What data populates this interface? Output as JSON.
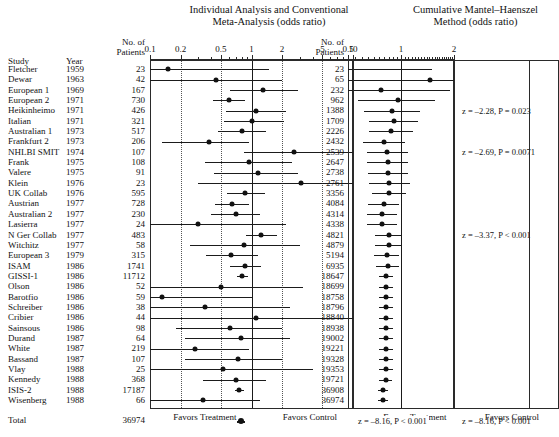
{
  "titles": {
    "left_line1": "Individual Analysis and Conventional",
    "left_line2": "Meta-Analysis (odds ratio)",
    "right_line1": "Cumulative Mantel–Haenszel",
    "right_line2": "Method (odds ratio)"
  },
  "headers": {
    "study": "Study",
    "year": "Year",
    "no_of": "No. of",
    "patients": "Patients",
    "no_of_2": "No. of",
    "patients_2": "Patients"
  },
  "footers": {
    "left_favors_treatment": "Favors Treatment",
    "left_favors_control": "Favors Control",
    "right_favors_treatment": "Favors Treatment",
    "right_favors_control": "Favors Control"
  },
  "annotations": [
    {
      "text": "z = –2.28, P = 0.023",
      "row": 4
    },
    {
      "text": "z = –2.69, P = 0.0071",
      "row": 8
    },
    {
      "text": "z = –3.37, P < 0.001",
      "row": 16
    },
    {
      "text": "z = –8.16, P < 0.001",
      "row": 25
    }
  ],
  "total_stat_left": "z = –8.16, P < 0.001",
  "total_row": {
    "study": "Total",
    "year": "",
    "patients": "36974",
    "cumulative": ""
  },
  "chart_data": {
    "type": "forest",
    "xlabel": "Odds ratio",
    "left_axis": {
      "scale": "log",
      "xlim": [
        0.1,
        10
      ],
      "ticks": [
        0.1,
        0.2,
        0.5,
        1,
        2,
        5,
        10
      ],
      "ticklabels": [
        "0.1",
        "0.2",
        "0.5",
        "1",
        "2",
        "5",
        "10"
      ],
      "reference": 1,
      "dotted_refs": [
        0.2,
        0.5,
        2,
        5
      ]
    },
    "right_axis": {
      "scale": "log",
      "xlim": [
        0.5,
        2
      ],
      "ticks": [
        0.5,
        1,
        2
      ],
      "ticklabels": [
        "0.5",
        "1",
        "2"
      ],
      "reference": 1
    },
    "studies": [
      {
        "study": "Fletcher",
        "year": "1959",
        "patients": "23",
        "or": 0.15,
        "lo": 0.03,
        "hi": 1.5,
        "cum_patients": "23",
        "cum_or": 0.15,
        "cum_lo": 0.03,
        "cum_hi": 1.5
      },
      {
        "study": "Dewar",
        "year": "1963",
        "patients": "42",
        "or": 0.45,
        "lo": 0.09,
        "hi": 2.0,
        "cum_patients": "65",
        "cum_or": 1.47,
        "cum_lo": 0.4,
        "cum_hi": 5.6
      },
      {
        "study": "European 1",
        "year": "1969",
        "patients": "167",
        "or": 1.3,
        "lo": 0.62,
        "hi": 2.9,
        "cum_patients": "232",
        "cum_or": 0.77,
        "cum_lo": 0.38,
        "cum_hi": 1.9
      },
      {
        "study": "European 2",
        "year": "1971",
        "patients": "730",
        "or": 0.6,
        "lo": 0.42,
        "hi": 0.86,
        "cum_patients": "962",
        "cum_or": 0.96,
        "cum_lo": 0.57,
        "cum_hi": 1.55
      },
      {
        "study": "Heikinheimo",
        "year": "1971",
        "patients": "426",
        "or": 1.1,
        "lo": 0.56,
        "hi": 2.2,
        "cum_patients": "1388",
        "cum_or": 0.89,
        "cum_lo": 0.62,
        "cum_hi": 1.28
      },
      {
        "study": "Italian",
        "year": "1971",
        "patients": "321",
        "or": 1.0,
        "lo": 0.53,
        "hi": 2.1,
        "cum_patients": "1709",
        "cum_or": 0.91,
        "cum_lo": 0.66,
        "cum_hi": 1.25
      },
      {
        "study": "Australian 1",
        "year": "1973",
        "patients": "517",
        "or": 0.8,
        "lo": 0.47,
        "hi": 1.4,
        "cum_patients": "2226",
        "cum_or": 0.88,
        "cum_lo": 0.66,
        "cum_hi": 1.17
      },
      {
        "study": "Frankfurt 2",
        "year": "1973",
        "patients": "206",
        "or": 0.38,
        "lo": 0.13,
        "hi": 0.95,
        "cum_patients": "2432",
        "cum_or": 0.8,
        "cum_lo": 0.61,
        "cum_hi": 1.06
      },
      {
        "study": "NHLBI SMIT",
        "year": "1974",
        "patients": "107",
        "or": 2.6,
        "lo": 0.84,
        "hi": 10.0,
        "cum_patients": "2539",
        "cum_or": 0.83,
        "cum_lo": 0.64,
        "cum_hi": 1.09
      },
      {
        "study": "Frank",
        "year": "1975",
        "patients": "108",
        "or": 0.95,
        "lo": 0.35,
        "hi": 2.5,
        "cum_patients": "2647",
        "cum_or": 0.84,
        "cum_lo": 0.64,
        "cum_hi": 1.09
      },
      {
        "study": "Valere",
        "year": "1975",
        "patients": "91",
        "or": 1.15,
        "lo": 0.43,
        "hi": 2.9,
        "cum_patients": "2738",
        "cum_or": 0.84,
        "cum_lo": 0.65,
        "cum_hi": 1.1
      },
      {
        "study": "Klein",
        "year": "1976",
        "patients": "23",
        "or": 3.1,
        "lo": 0.3,
        "hi": 10.0,
        "cum_patients": "2761",
        "cum_or": 0.86,
        "cum_lo": 0.66,
        "cum_hi": 1.12
      },
      {
        "study": "UK Collab",
        "year": "1976",
        "patients": "595",
        "or": 0.87,
        "lo": 0.58,
        "hi": 1.35,
        "cum_patients": "3356",
        "cum_or": 0.85,
        "cum_lo": 0.68,
        "cum_hi": 1.07
      },
      {
        "study": "Austrian",
        "year": "1977",
        "patients": "728",
        "or": 0.64,
        "lo": 0.44,
        "hi": 0.95,
        "cum_patients": "4084",
        "cum_or": 0.8,
        "cum_lo": 0.65,
        "cum_hi": 0.98
      },
      {
        "study": "Australian 2",
        "year": "1977",
        "patients": "230",
        "or": 0.7,
        "lo": 0.4,
        "hi": 1.2,
        "cum_patients": "4314",
        "cum_or": 0.78,
        "cum_lo": 0.64,
        "cum_hi": 0.95
      },
      {
        "study": "Lasierra",
        "year": "1977",
        "patients": "24",
        "or": 0.3,
        "lo": 0.04,
        "hi": 2.2,
        "cum_patients": "4338",
        "cum_or": 0.78,
        "cum_lo": 0.64,
        "cum_hi": 0.95
      },
      {
        "study": "N Ger Collab",
        "year": "1977",
        "patients": "483",
        "or": 1.25,
        "lo": 0.88,
        "hi": 1.8,
        "cum_patients": "4821",
        "cum_or": 0.85,
        "cum_lo": 0.71,
        "cum_hi": 1.01
      },
      {
        "study": "Witchitz",
        "year": "1977",
        "patients": "58",
        "or": 0.85,
        "lo": 0.25,
        "hi": 3.0,
        "cum_patients": "4879",
        "cum_or": 0.85,
        "cum_lo": 0.71,
        "cum_hi": 1.01
      },
      {
        "study": "European 3",
        "year": "1979",
        "patients": "315",
        "or": 0.63,
        "lo": 0.36,
        "hi": 1.15,
        "cum_patients": "5194",
        "cum_or": 0.83,
        "cum_lo": 0.7,
        "cum_hi": 0.98
      },
      {
        "study": "ISAM",
        "year": "1986",
        "patients": "1741",
        "or": 0.87,
        "lo": 0.62,
        "hi": 1.25,
        "cum_patients": "6935",
        "cum_or": 0.84,
        "cum_lo": 0.72,
        "cum_hi": 0.97
      },
      {
        "study": "GISSI-1",
        "year": "1986",
        "patients": "11712",
        "or": 0.81,
        "lo": 0.72,
        "hi": 0.92,
        "cum_patients": "18647",
        "cum_or": 0.82,
        "cum_lo": 0.75,
        "cum_hi": 0.9
      },
      {
        "study": "Olson",
        "year": "1986",
        "patients": "52",
        "or": 0.5,
        "lo": 0.08,
        "hi": 3.2,
        "cum_patients": "18699",
        "cum_or": 0.82,
        "cum_lo": 0.75,
        "cum_hi": 0.9
      },
      {
        "study": "Barotfio",
        "year": "1986",
        "patients": "59",
        "or": 0.13,
        "lo": 0.01,
        "hi": 1.0,
        "cum_patients": "18758",
        "cum_or": 0.82,
        "cum_lo": 0.75,
        "cum_hi": 0.9
      },
      {
        "study": "Schreiber",
        "year": "1986",
        "patients": "38",
        "or": 0.35,
        "lo": 0.05,
        "hi": 2.4,
        "cum_patients": "18796",
        "cum_or": 0.82,
        "cum_lo": 0.75,
        "cum_hi": 0.9
      },
      {
        "study": "Cribier",
        "year": "1986",
        "patients": "44",
        "or": 1.1,
        "lo": 0.1,
        "hi": 10.0,
        "cum_patients": "18840",
        "cum_or": 0.82,
        "cum_lo": 0.75,
        "cum_hi": 0.9
      },
      {
        "study": "Sainsous",
        "year": "1986",
        "patients": "98",
        "or": 0.62,
        "lo": 0.18,
        "hi": 2.0,
        "cum_patients": "18938",
        "cum_or": 0.82,
        "cum_lo": 0.75,
        "cum_hi": 0.9
      },
      {
        "study": "Durand",
        "year": "1987",
        "patients": "64",
        "or": 0.78,
        "lo": 0.22,
        "hi": 2.4,
        "cum_patients": "19002",
        "cum_or": 0.82,
        "cum_lo": 0.75,
        "cum_hi": 0.9
      },
      {
        "study": "White",
        "year": "1987",
        "patients": "219",
        "or": 0.28,
        "lo": 0.09,
        "hi": 0.95,
        "cum_patients": "19221",
        "cum_or": 0.82,
        "cum_lo": 0.75,
        "cum_hi": 0.9
      },
      {
        "study": "Bassand",
        "year": "1987",
        "patients": "107",
        "or": 0.74,
        "lo": 0.22,
        "hi": 2.0,
        "cum_patients": "19328",
        "cum_or": 0.82,
        "cum_lo": 0.75,
        "cum_hi": 0.9
      },
      {
        "study": "Vlay",
        "year": "1988",
        "patients": "25",
        "or": 0.52,
        "lo": 0.06,
        "hi": 4.0,
        "cum_patients": "19353",
        "cum_or": 0.82,
        "cum_lo": 0.75,
        "cum_hi": 0.9
      },
      {
        "study": "Kennedy",
        "year": "1988",
        "patients": "368",
        "or": 0.7,
        "lo": 0.33,
        "hi": 1.4,
        "cum_patients": "19721",
        "cum_or": 0.82,
        "cum_lo": 0.75,
        "cum_hi": 0.89
      },
      {
        "study": "ISIS-2",
        "year": "1988",
        "patients": "17187",
        "or": 0.76,
        "lo": 0.69,
        "hi": 0.84,
        "cum_patients": "36908",
        "cum_or": 0.79,
        "cum_lo": 0.74,
        "cum_hi": 0.84
      },
      {
        "study": "Wisenberg",
        "year": "1988",
        "patients": "66",
        "or": 0.33,
        "lo": 0.08,
        "hi": 1.2,
        "cum_patients": "36974",
        "cum_or": 0.79,
        "cum_lo": 0.74,
        "cum_hi": 0.84
      }
    ],
    "total": {
      "study": "Total",
      "patients": "36974",
      "or": 0.79,
      "lo": 0.72,
      "hi": 0.86,
      "cum_or": 0.79,
      "cum_lo": 0.74,
      "cum_hi": 0.84
    }
  }
}
